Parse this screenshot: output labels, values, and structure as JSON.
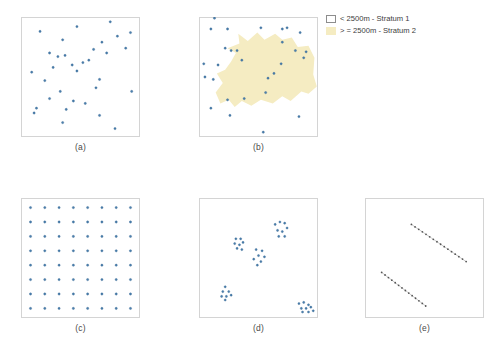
{
  "figure": {
    "panels": [
      {
        "id": "a",
        "label": "(a)",
        "design": "simple random sampling"
      },
      {
        "id": "b",
        "label": "(b)",
        "design": "stratified sampling"
      },
      {
        "id": "c",
        "label": "(c)",
        "design": "systematic grid sampling"
      },
      {
        "id": "d",
        "label": "(d)",
        "design": "cluster sampling"
      },
      {
        "id": "e",
        "label": "(e)",
        "design": "transect sampling"
      }
    ]
  },
  "legend": {
    "items": [
      {
        "swatch": "stratum1",
        "label": "< 2500m - Stratum 1",
        "color": "#ffffff",
        "border": "#8d8d8d"
      },
      {
        "swatch": "stratum2",
        "label": "> = 2500m - Stratum 2",
        "color": "#f5ecc2",
        "border": "#f5ecc2"
      }
    ]
  },
  "style": {
    "point_color": "#4a7fae",
    "point_edge": "#2f5f8c",
    "transect_point_color": "#555555",
    "transect_line_color": "#8a8a8a",
    "frame_color": "#d4d4d4",
    "stratum_fill": "#f5ecc2"
  },
  "chart_data": [
    {
      "type": "scatter",
      "panel": "a",
      "title": "(a)",
      "xlabel": "",
      "ylabel": "",
      "xlim": [
        0,
        100
      ],
      "ylim": [
        0,
        100
      ],
      "grid": false,
      "legend": "none",
      "series": [
        {
          "name": "random sample points",
          "color": "#4a7fae",
          "points": [
            [
              16,
              88
            ],
            [
              47,
              92
            ],
            [
              75,
              96
            ],
            [
              81,
              84
            ],
            [
              92,
              87
            ],
            [
              35,
              81
            ],
            [
              68,
              79
            ],
            [
              88,
              74
            ],
            [
              24,
              70
            ],
            [
              31,
              67
            ],
            [
              37,
              68
            ],
            [
              61,
              73
            ],
            [
              72,
              70
            ],
            [
              43,
              60
            ],
            [
              52,
              62
            ],
            [
              57,
              64
            ],
            [
              27,
              58
            ],
            [
              9,
              54
            ],
            [
              47,
              55
            ],
            [
              66,
              48
            ],
            [
              20,
              47
            ],
            [
              63,
              41
            ],
            [
              33,
              38
            ],
            [
              24,
              32
            ],
            [
              44,
              30
            ],
            [
              93,
              38
            ],
            [
              13,
              24
            ],
            [
              11,
              20
            ],
            [
              38,
              23
            ],
            [
              54,
              28
            ],
            [
              66,
              18
            ],
            [
              35,
              12
            ],
            [
              79,
              7
            ]
          ]
        }
      ]
    },
    {
      "type": "scatter",
      "panel": "b",
      "title": "(b)",
      "xlabel": "",
      "ylabel": "",
      "xlim": [
        0,
        100
      ],
      "ylim": [
        0,
        100
      ],
      "grid": false,
      "legend": "top-right",
      "strata": [
        {
          "name": "Stratum 1",
          "condition": "< 2500m",
          "fill": "#ffffff"
        },
        {
          "name": "Stratum 2",
          "condition": "> = 2500m",
          "fill": "#f5ecc2"
        }
      ],
      "series": [
        {
          "name": "stratified sample points",
          "color": "#4a7fae",
          "points": [
            [
              13,
              99
            ],
            [
              10,
              90
            ],
            [
              24,
              90
            ],
            [
              52,
              91
            ],
            [
              70,
              90
            ],
            [
              74,
              91
            ],
            [
              85,
              87
            ],
            [
              70,
              79
            ],
            [
              22,
              74
            ],
            [
              27,
              72
            ],
            [
              32,
              72
            ],
            [
              81,
              72
            ],
            [
              90,
              71
            ],
            [
              88,
              66
            ],
            [
              4,
              61
            ],
            [
              16,
              60
            ],
            [
              36,
              64
            ],
            [
              69,
              61
            ],
            [
              63,
              53
            ],
            [
              58,
              49
            ],
            [
              5,
              50
            ],
            [
              12,
              48
            ],
            [
              56,
              37
            ],
            [
              38,
              32
            ],
            [
              24,
              31
            ],
            [
              10,
              24
            ],
            [
              26,
              18
            ],
            [
              84,
              17
            ],
            [
              54,
              4
            ]
          ]
        }
      ]
    },
    {
      "type": "scatter",
      "panel": "c",
      "title": "(c)",
      "xlabel": "",
      "ylabel": "",
      "xlim": [
        0,
        100
      ],
      "ylim": [
        0,
        100
      ],
      "grid": false,
      "legend": "none",
      "description": "regular 8 by 8 systematic grid",
      "grid_spec": {
        "cols": 8,
        "rows": 8,
        "x_start": 8,
        "x_step": 12,
        "y_start": 8,
        "y_step": 12
      },
      "series": [
        {
          "name": "systematic grid points",
          "color": "#4a7fae",
          "count": 64
        }
      ]
    },
    {
      "type": "scatter",
      "panel": "d",
      "title": "(d)",
      "xlabel": "",
      "ylabel": "",
      "xlim": [
        0,
        100
      ],
      "ylim": [
        0,
        100
      ],
      "grid": false,
      "legend": "none",
      "description": "five spatial clusters of points",
      "series": [
        {
          "name": "cluster sample points",
          "color": "#4a7fae",
          "clusters": [
            {
              "center": [
                69,
                74
              ],
              "points": [
                [
                  64,
                  78
                ],
                [
                  68,
                  80
                ],
                [
                  72,
                  79
                ],
                [
                  66,
                  73
                ],
                [
                  70,
                  72
                ],
                [
                  74,
                  75
                ],
                [
                  67,
                  68
                ],
                [
                  72,
                  68
                ]
              ]
            },
            {
              "center": [
                34,
                62
              ],
              "points": [
                [
                  31,
                  66
                ],
                [
                  35,
                  66
                ],
                [
                  30,
                  62
                ],
                [
                  34,
                  61
                ],
                [
                  37,
                  63
                ],
                [
                  32,
                  58
                ],
                [
                  36,
                  57
                ]
              ]
            },
            {
              "center": [
                51,
                52
              ],
              "points": [
                [
                  48,
                  57
                ],
                [
                  53,
                  56
                ],
                [
                  50,
                  52
                ],
                [
                  55,
                  51
                ],
                [
                  46,
                  49
                ],
                [
                  52,
                  47
                ],
                [
                  49,
                  44
                ]
              ]
            },
            {
              "center": [
                23,
                21
              ],
              "points": [
                [
                  22,
                  26
                ],
                [
                  20,
                  22
                ],
                [
                  25,
                  22
                ],
                [
                  19,
                  18
                ],
                [
                  23,
                  18
                ],
                [
                  27,
                  19
                ],
                [
                  22,
                  15
                ]
              ]
            },
            {
              "center": [
                89,
                9
              ],
              "points": [
                [
                  84,
                  12
                ],
                [
                  88,
                  13
                ],
                [
                  92,
                  11
                ],
                [
                  86,
                  8
                ],
                [
                  90,
                  8
                ],
                [
                  94,
                  9
                ],
                [
                  87,
                  5
                ],
                [
                  92,
                  5
                ],
                [
                  96,
                  6
                ]
              ]
            }
          ]
        }
      ]
    },
    {
      "type": "scatter",
      "panel": "e",
      "title": "(e)",
      "xlabel": "",
      "ylabel": "",
      "xlim": [
        0,
        100
      ],
      "ylim": [
        0,
        100
      ],
      "grid": false,
      "legend": "none",
      "description": "two linear transects sampled at regular intervals",
      "series": [
        {
          "name": "transect 1",
          "color": "#555555",
          "line": {
            "x1": 39,
            "y1": 78,
            "x2": 85,
            "y2": 47
          },
          "n_points": 16
        },
        {
          "name": "transect 2",
          "color": "#555555",
          "line": {
            "x1": 14,
            "y1": 38,
            "x2": 51,
            "y2": 10
          },
          "n_points": 14
        }
      ]
    }
  ]
}
